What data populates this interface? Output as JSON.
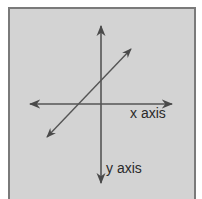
{
  "diagram": {
    "type": "coordinate-axes",
    "colors": {
      "background": "#d3d3d3",
      "border": "#7a7a7a",
      "line": "#4a4a4a",
      "text": "#2a2a2a"
    },
    "labels": {
      "x_axis": "x axis",
      "y_axis": "y axis"
    },
    "elements": [
      {
        "name": "x-axis",
        "from": [
          30,
          104
        ],
        "to": [
          172,
          104
        ],
        "arrows": "both"
      },
      {
        "name": "y-axis",
        "from": [
          101,
          26
        ],
        "to": [
          101,
          183
        ],
        "arrows": "both"
      },
      {
        "name": "diagonal-line",
        "from": [
          47,
          137
        ],
        "to": [
          131,
          49
        ],
        "arrows": "both"
      }
    ]
  }
}
